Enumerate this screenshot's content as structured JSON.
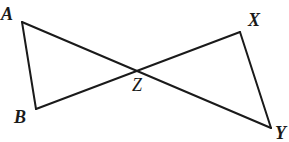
{
  "figure": {
    "background_color": "#ffffff",
    "stroke_color": "#1a1a1a",
    "stroke_width": 2,
    "width": 289,
    "height": 142,
    "points": {
      "A": {
        "label": "A",
        "x": 22,
        "y": 22
      },
      "B": {
        "label": "B",
        "x": 36,
        "y": 109
      },
      "X": {
        "label": "X",
        "x": 240,
        "y": 32
      },
      "Y": {
        "label": "Y",
        "x": 271,
        "y": 128
      },
      "Z": {
        "label": "Z",
        "x": 139,
        "y": 71
      }
    },
    "segments": [
      {
        "name": "segment-AB",
        "from": "A",
        "to": "B"
      },
      {
        "name": "segment-AY",
        "from": "A",
        "to": "Y"
      },
      {
        "name": "segment-BX",
        "from": "B",
        "to": "X"
      },
      {
        "name": "segment-XY",
        "from": "X",
        "to": "Y"
      }
    ],
    "labels": {
      "A": "A",
      "B": "B",
      "X": "X",
      "Y": "Y",
      "Z": "Z"
    }
  }
}
